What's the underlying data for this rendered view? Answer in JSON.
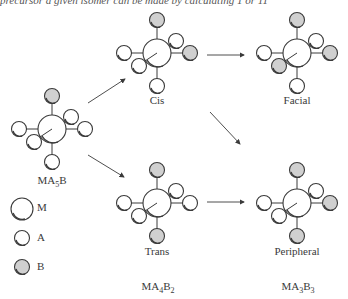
{
  "top_text": "precursor a given isomer can be made by calculating 1 or 11",
  "colors": {
    "atom_A": "#ffffff",
    "atom_B": "#d0d0d0",
    "atom_M": "#ffffff",
    "stroke": "#3a3a3a"
  },
  "molecules": [
    {
      "id": "ma5b",
      "label": "MA₅B",
      "formula_base": "MA",
      "sub1": "5",
      "tail": "B",
      "sub2": ""
    },
    {
      "id": "cis",
      "label": "Cis"
    },
    {
      "id": "facial",
      "label": "Facial"
    },
    {
      "id": "trans",
      "label": "Trans"
    },
    {
      "id": "peripheral",
      "label": "Peripheral"
    }
  ],
  "formulas": {
    "ma5b": {
      "a": "MA",
      "s1": "5",
      "b": "B",
      "s2": ""
    },
    "ma4b2": {
      "a": "MA",
      "s1": "4",
      "b": "B",
      "s2": "2"
    },
    "ma3b3": {
      "a": "MA",
      "s1": "3",
      "b": "B",
      "s2": "3"
    }
  },
  "legend": [
    {
      "key": "M",
      "label": "M"
    },
    {
      "key": "A",
      "label": "A"
    },
    {
      "key": "B",
      "label": "B"
    }
  ]
}
